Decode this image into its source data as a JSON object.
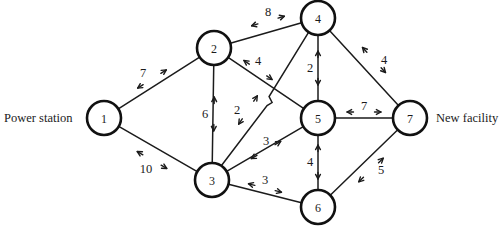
{
  "figure": {
    "title": "",
    "type": "undirected-weighted-network-graph",
    "background_color": "#ffffff",
    "line_color": "#1b1b1b",
    "node_fill_color": "#ffffff"
  },
  "endpoint_labels": {
    "source": "Power station",
    "target": "New facility"
  },
  "nodes": [
    {
      "id": "1",
      "label": "1",
      "x": 104,
      "y": 118,
      "r": 17
    },
    {
      "id": "2",
      "label": "2",
      "x": 214,
      "y": 48,
      "r": 17
    },
    {
      "id": "3",
      "label": "3",
      "x": 212,
      "y": 180,
      "r": 17
    },
    {
      "id": "4",
      "label": "4",
      "x": 318,
      "y": 18,
      "r": 17
    },
    {
      "id": "5",
      "label": "5",
      "x": 318,
      "y": 118,
      "r": 17
    },
    {
      "id": "6",
      "label": "6",
      "x": 318,
      "y": 207,
      "r": 17
    },
    {
      "id": "7",
      "label": "7",
      "x": 410,
      "y": 118,
      "r": 17
    }
  ],
  "edges": [
    {
      "id": "e-1-2",
      "from": "1",
      "to": "2",
      "weight": "7",
      "label_x": 152,
      "label_y": 79,
      "label_dx": -9,
      "label_dy": -6
    },
    {
      "id": "e-1-3",
      "from": "1",
      "to": "3",
      "weight": "10",
      "label_x": 152,
      "label_y": 160,
      "label_dx": -6,
      "label_dy": 9
    },
    {
      "id": "e-2-3",
      "from": "2",
      "to": "3",
      "weight": "6",
      "label_x": 214,
      "label_y": 114,
      "label_dx": -9,
      "label_dy": 0
    },
    {
      "id": "e-2-4",
      "from": "2",
      "to": "4",
      "weight": "8",
      "label_x": 268,
      "label_y": 21,
      "label_dx": 0,
      "label_dy": -9
    },
    {
      "id": "e-2-5",
      "from": "2",
      "to": "5",
      "weight": "4",
      "label_x": 258,
      "label_y": 70,
      "label_dx": 0,
      "label_dy": -9
    },
    {
      "id": "e-3-4",
      "from": "3",
      "to": "4",
      "weight": "2",
      "label_x": 248,
      "label_y": 110,
      "label_dx": -11,
      "label_dy": 0
    },
    {
      "id": "e-3-5",
      "from": "3",
      "to": "5",
      "weight": "3",
      "label_x": 266,
      "label_y": 150,
      "label_dx": 0,
      "label_dy": -9
    },
    {
      "id": "e-3-6",
      "from": "3",
      "to": "6",
      "weight": "3",
      "label_x": 265,
      "label_y": 188,
      "label_dx": 0,
      "label_dy": -8
    },
    {
      "id": "e-4-5",
      "from": "4",
      "to": "5",
      "weight": "2",
      "label_x": 318,
      "label_y": 68,
      "label_dx": -8,
      "label_dy": 0
    },
    {
      "id": "e-4-7",
      "from": "4",
      "to": "7",
      "weight": "4",
      "label_x": 374,
      "label_y": 60,
      "label_dx": 10,
      "label_dy": 0
    },
    {
      "id": "e-5-6",
      "from": "5",
      "to": "6",
      "weight": "4",
      "label_x": 318,
      "label_y": 162,
      "label_dx": -8,
      "label_dy": 0
    },
    {
      "id": "e-5-7",
      "from": "5",
      "to": "7",
      "weight": "7",
      "label_x": 364,
      "label_y": 112,
      "label_dx": 0,
      "label_dy": -6
    },
    {
      "id": "e-6-7",
      "from": "6",
      "to": "7",
      "weight": "5",
      "label_x": 371,
      "label_y": 170,
      "label_dx": 10,
      "label_dy": 0
    }
  ],
  "crossing": {
    "note": "edge 3-4 hops over edge 2-5 with a small jog near (272, 98)"
  }
}
